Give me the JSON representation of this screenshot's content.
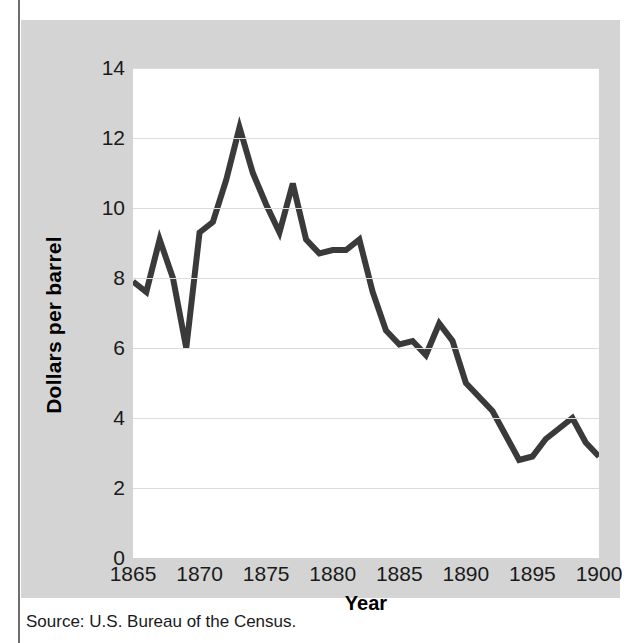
{
  "figure": {
    "top_clipped_caption": "",
    "source_note": "Source: U.S. Bureau of the Census.",
    "panel_color": "#d4d4d4",
    "plot_background": "#ffffff",
    "line_color": "#3a3a3a",
    "gridline_color": "#dcdcdc"
  },
  "chart_data": {
    "type": "line",
    "title": "",
    "xlabel": "Year",
    "ylabel": "Dollars per barrel",
    "xlim": [
      1865,
      1900
    ],
    "ylim": [
      0,
      14
    ],
    "xticks": [
      1865,
      1870,
      1875,
      1880,
      1885,
      1890,
      1895,
      1900
    ],
    "yticks": [
      0,
      2,
      4,
      6,
      8,
      10,
      12,
      14
    ],
    "grid": "horizontal",
    "legend": "none",
    "x": [
      1865,
      1866,
      1867,
      1868,
      1869,
      1870,
      1871,
      1872,
      1873,
      1874,
      1875,
      1876,
      1877,
      1878,
      1879,
      1880,
      1881,
      1882,
      1883,
      1884,
      1885,
      1886,
      1887,
      1888,
      1889,
      1890,
      1891,
      1892,
      1893,
      1894,
      1895,
      1896,
      1897,
      1898,
      1899,
      1900
    ],
    "values": [
      7.9,
      7.6,
      9.1,
      8.0,
      6.0,
      9.3,
      9.6,
      10.8,
      12.3,
      11.0,
      10.1,
      9.3,
      10.7,
      9.1,
      8.7,
      8.8,
      8.8,
      9.1,
      7.6,
      6.5,
      6.1,
      6.2,
      5.8,
      6.7,
      6.2,
      5.0,
      4.6,
      4.2,
      3.5,
      2.8,
      2.9,
      3.4,
      3.7,
      4.0,
      3.3,
      2.9
    ],
    "series_name": "Price per barrel"
  },
  "axis_labels": {
    "y": [
      "14",
      "12",
      "10",
      "8",
      "6",
      "4",
      "2",
      "0"
    ],
    "x": [
      "1865",
      "1870",
      "1875",
      "1880",
      "1885",
      "1890",
      "1895",
      "1900"
    ]
  }
}
